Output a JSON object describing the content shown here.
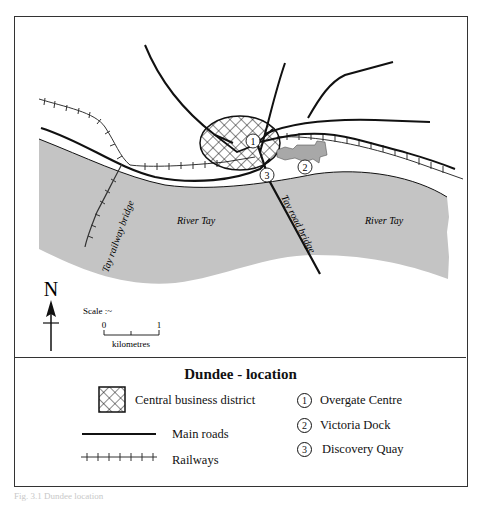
{
  "map": {
    "labels": {
      "river_west": "River Tay",
      "river_east": "River Tay",
      "rail_bridge": "Tay railway bridge",
      "road_bridge": "Tay road bridge",
      "marker_1": "1",
      "marker_2": "2",
      "marker_3": "3"
    },
    "north_arrow": {
      "label": "N"
    },
    "scale": {
      "title": "Scale :~",
      "start": "0",
      "end": "1",
      "unit": "kilometres"
    },
    "colors": {
      "water": "#c4c4c4",
      "lines": "#111111",
      "dock": "#a8a8a8",
      "frame": "#333333"
    }
  },
  "legend": {
    "title": "Dundee - location",
    "items": [
      {
        "symbol": "crosshatch-box",
        "label": "Central business district"
      },
      {
        "symbol": "solid-line",
        "label": "Main roads"
      },
      {
        "symbol": "railway-line",
        "label": "Railways"
      }
    ],
    "places": [
      {
        "number": "1",
        "label": "Overgate Centre"
      },
      {
        "number": "2",
        "label": "Victoria Dock"
      },
      {
        "number": "3",
        "label": "Discovery Quay"
      }
    ]
  },
  "caption": "Fig. 3.1  Dundee location"
}
